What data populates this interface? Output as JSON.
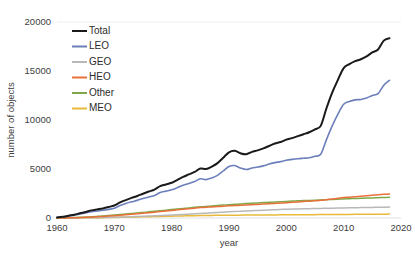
{
  "chart_data": {
    "type": "line",
    "title": "",
    "xlabel": "year",
    "ylabel": "number of objects",
    "xlim": [
      1960,
      2020
    ],
    "ylim": [
      0,
      20000
    ],
    "xticks": [
      1960,
      1970,
      1980,
      1990,
      2000,
      2010,
      2020
    ],
    "yticks": [
      0,
      5000,
      10000,
      15000,
      20000
    ],
    "xtick_labels": [
      "1960",
      "1970",
      "1980",
      "1990",
      "2000",
      "2010",
      "2020"
    ],
    "ytick_labels": [
      "0",
      "5000",
      "10000",
      "15000",
      "20000"
    ],
    "grid": "top-only",
    "legend_position": "upper-left-inside",
    "x": [
      1960,
      1961,
      1962,
      1963,
      1964,
      1965,
      1966,
      1967,
      1968,
      1969,
      1970,
      1971,
      1972,
      1973,
      1974,
      1975,
      1976,
      1977,
      1978,
      1979,
      1980,
      1981,
      1982,
      1983,
      1984,
      1985,
      1986,
      1987,
      1988,
      1989,
      1990,
      1991,
      1992,
      1993,
      1994,
      1995,
      1996,
      1997,
      1998,
      1999,
      2000,
      2001,
      2002,
      2003,
      2004,
      2005,
      2006,
      2007,
      2008,
      2009,
      2010,
      2011,
      2012,
      2013,
      2014,
      2015,
      2016,
      2017,
      2018
    ],
    "series": [
      {
        "name": "Total",
        "color": "#1a1a1a",
        "width": 2.0,
        "values": [
          60,
          120,
          230,
          330,
          480,
          620,
          780,
          880,
          980,
          1120,
          1280,
          1600,
          1830,
          2050,
          2250,
          2480,
          2700,
          2900,
          3250,
          3420,
          3600,
          3900,
          4200,
          4450,
          4700,
          5050,
          5000,
          5250,
          5600,
          6150,
          6700,
          6850,
          6600,
          6500,
          6750,
          6900,
          7100,
          7350,
          7600,
          7750,
          8000,
          8150,
          8350,
          8550,
          8750,
          9050,
          9400,
          11200,
          12800,
          14100,
          15300,
          15700,
          16000,
          16200,
          16500,
          16900,
          17200,
          18100,
          18350
        ]
      },
      {
        "name": "LEO",
        "color": "#6b7fbb",
        "width": 1.6,
        "values": [
          55,
          110,
          200,
          280,
          400,
          520,
          640,
          720,
          790,
          880,
          1000,
          1280,
          1480,
          1650,
          1800,
          1980,
          2150,
          2300,
          2600,
          2740,
          2880,
          3100,
          3350,
          3520,
          3720,
          4000,
          3920,
          4080,
          4350,
          4800,
          5250,
          5350,
          5100,
          4950,
          5100,
          5200,
          5320,
          5500,
          5650,
          5750,
          5900,
          5980,
          6050,
          6100,
          6150,
          6300,
          6500,
          8000,
          9400,
          10600,
          11600,
          11900,
          12050,
          12100,
          12250,
          12500,
          12700,
          13550,
          14050
        ]
      },
      {
        "name": "GEO",
        "color": "#b8b8b8",
        "width": 1.5,
        "values": [
          0,
          0,
          2,
          5,
          10,
          16,
          24,
          34,
          46,
          60,
          76,
          94,
          112,
          132,
          154,
          176,
          200,
          224,
          250,
          276,
          304,
          332,
          362,
          392,
          424,
          456,
          490,
          524,
          560,
          596,
          634,
          662,
          690,
          718,
          746,
          774,
          802,
          828,
          852,
          874,
          896,
          914,
          930,
          944,
          956,
          968,
          980,
          992,
          1004,
          1016,
          1028,
          1040,
          1052,
          1062,
          1072,
          1082,
          1092,
          1100,
          1110
        ]
      },
      {
        "name": "HEO",
        "color": "#e8703a",
        "width": 1.5,
        "values": [
          2,
          6,
          14,
          26,
          44,
          66,
          94,
          124,
          158,
          196,
          238,
          282,
          330,
          380,
          432,
          486,
          542,
          598,
          656,
          714,
          772,
          830,
          888,
          946,
          1004,
          1060,
          1100,
          1130,
          1165,
          1200,
          1240,
          1270,
          1295,
          1320,
          1350,
          1385,
          1420,
          1455,
          1490,
          1525,
          1560,
          1600,
          1640,
          1680,
          1720,
          1760,
          1800,
          1870,
          1950,
          2020,
          2080,
          2130,
          2180,
          2230,
          2280,
          2330,
          2380,
          2420,
          2450
        ]
      },
      {
        "name": "Other",
        "color": "#7fa84a",
        "width": 1.5,
        "values": [
          4,
          10,
          22,
          40,
          64,
          94,
          128,
          166,
          208,
          252,
          300,
          350,
          402,
          456,
          512,
          570,
          628,
          686,
          744,
          802,
          860,
          918,
          976,
          1032,
          1086,
          1138,
          1186,
          1232,
          1276,
          1318,
          1360,
          1398,
          1434,
          1468,
          1502,
          1536,
          1570,
          1602,
          1634,
          1664,
          1694,
          1722,
          1748,
          1774,
          1798,
          1822,
          1846,
          1872,
          1898,
          1922,
          1946,
          1968,
          1990,
          2010,
          2030,
          2050,
          2070,
          2090,
          2110
        ]
      },
      {
        "name": "MEO",
        "color": "#e8b93a",
        "width": 1.5,
        "values": [
          0,
          1,
          3,
          6,
          10,
          16,
          22,
          30,
          38,
          48,
          58,
          68,
          80,
          92,
          104,
          118,
          132,
          146,
          160,
          174,
          188,
          202,
          216,
          228,
          240,
          250,
          258,
          266,
          272,
          278,
          284,
          288,
          292,
          296,
          300,
          304,
          308,
          312,
          316,
          320,
          324,
          328,
          332,
          336,
          340,
          344,
          348,
          352,
          356,
          360,
          364,
          368,
          372,
          376,
          380,
          384,
          388,
          392,
          396
        ]
      }
    ],
    "legend": [
      {
        "label": "Total",
        "color": "#1a1a1a"
      },
      {
        "label": "LEO",
        "color": "#6b7fbb"
      },
      {
        "label": "GEO",
        "color": "#b8b8b8"
      },
      {
        "label": "HEO",
        "color": "#e8703a"
      },
      {
        "label": "Other",
        "color": "#7fa84a"
      },
      {
        "label": "MEO",
        "color": "#e8b93a"
      }
    ]
  }
}
